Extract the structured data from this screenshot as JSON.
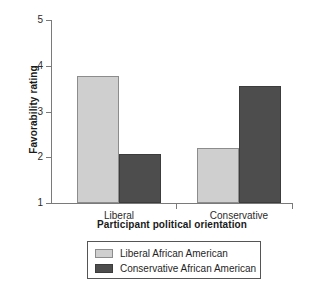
{
  "chart_data": {
    "type": "bar",
    "title": "",
    "subtitle": "",
    "xlabel": "Participant political orientation",
    "ylabel": "Favorability rating",
    "categories": [
      "Liberal",
      "Conservative"
    ],
    "series": [
      {
        "name": "Liberal African American",
        "color": "#cfcfcf",
        "values": [
          3.78,
          2.2
        ]
      },
      {
        "name": "Conservative African American",
        "color": "#4d4d4d",
        "values": [
          2.08,
          3.55
        ]
      }
    ],
    "ylim": [
      1,
      5
    ],
    "yticks": [
      1,
      2,
      3,
      4,
      5
    ],
    "ytick_labels": [
      "1",
      "2",
      "3",
      "4",
      "5"
    ],
    "grid": false,
    "legend_position": "below-axes",
    "legend_entries": [
      "Liberal African American",
      "Conservative African American"
    ]
  },
  "axes": {
    "y_title": "Favorability rating",
    "x_title": "Participant political orientation",
    "y_tick_1": "1",
    "y_tick_2": "2",
    "y_tick_3": "3",
    "y_tick_4": "4",
    "y_tick_5": "5",
    "x_tick_1": "Liberal",
    "x_tick_2": "Conservative"
  },
  "legend": {
    "entry_1": "Liberal African American",
    "entry_2": "Conservative African American"
  }
}
